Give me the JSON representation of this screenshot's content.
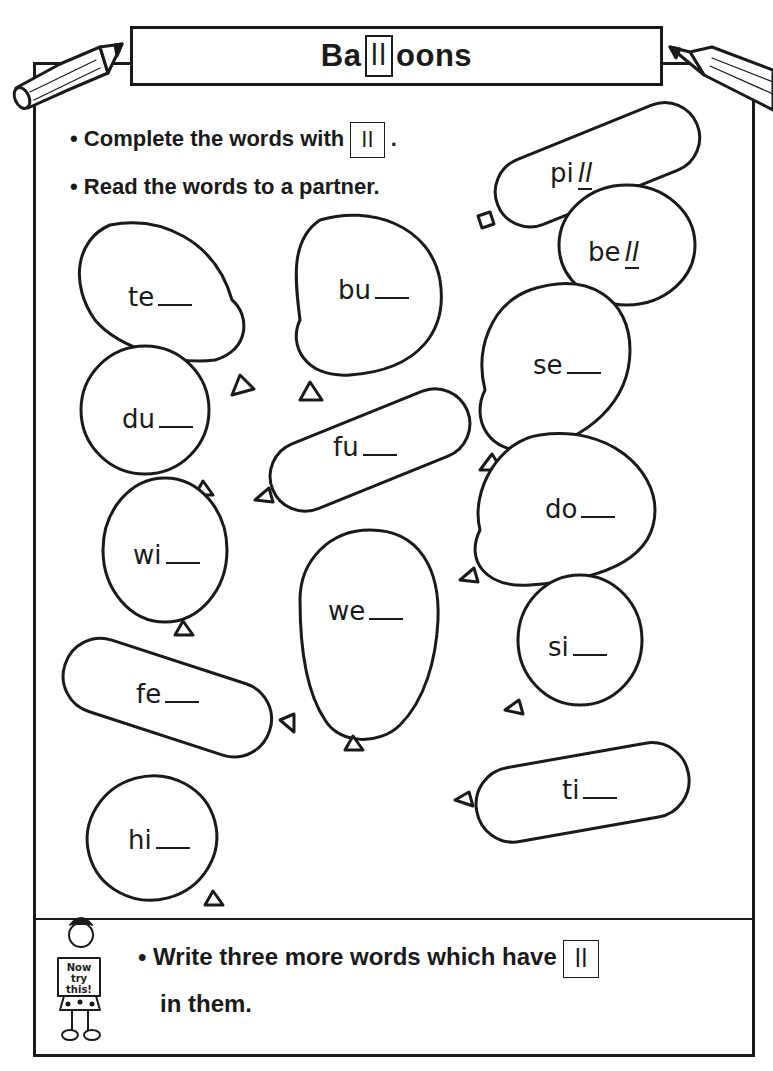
{
  "title": {
    "prefix": "Ba",
    "boxed": "ll",
    "suffix": "oons"
  },
  "instructions": [
    {
      "bullet": "•",
      "text": "Complete the words with",
      "boxed": "ll",
      "end": "."
    },
    {
      "bullet": "•",
      "text": "Read the words to a partner."
    }
  ],
  "balloons": [
    {
      "stem": "pi",
      "answer": "ll",
      "completed": true
    },
    {
      "stem": "be",
      "answer": "ll",
      "completed": true
    },
    {
      "stem": "te",
      "answer": "",
      "completed": false
    },
    {
      "stem": "bu",
      "answer": "",
      "completed": false
    },
    {
      "stem": "se",
      "answer": "",
      "completed": false
    },
    {
      "stem": "du",
      "answer": "",
      "completed": false
    },
    {
      "stem": "fu",
      "answer": "",
      "completed": false
    },
    {
      "stem": "do",
      "answer": "",
      "completed": false
    },
    {
      "stem": "wi",
      "answer": "",
      "completed": false
    },
    {
      "stem": "we",
      "answer": "",
      "completed": false
    },
    {
      "stem": "si",
      "answer": "",
      "completed": false
    },
    {
      "stem": "fe",
      "answer": "",
      "completed": false
    },
    {
      "stem": "ti",
      "answer": "",
      "completed": false
    },
    {
      "stem": "hi",
      "answer": "",
      "completed": false
    }
  ],
  "now_try_this": {
    "sign": [
      "Now",
      "try",
      "this!"
    ],
    "bullet": "•",
    "line1": "Write three more words which have",
    "boxed": "ll",
    "line2": "in them."
  },
  "colors": {
    "ink": "#1a1a1a",
    "paper": "#ffffff"
  }
}
